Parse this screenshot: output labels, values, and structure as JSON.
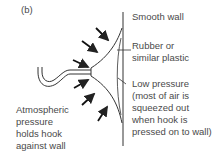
{
  "figure": {
    "panel_label": "(b)",
    "labels": {
      "smooth_wall": "Smooth wall",
      "rubber_line1": "Rubber or",
      "rubber_line2": "similar plastic",
      "low_line1": "Low pressure",
      "low_line2": "(most of air is",
      "low_line3": "squeezed out",
      "low_line4": "when hook is",
      "low_line5": "pressed on to wall)",
      "atm_line1": "Atmospheric",
      "atm_line2": "pressure",
      "atm_line3": "holds hook",
      "atm_line4": "against wall"
    },
    "colors": {
      "line": "#333333",
      "text": "#4a4a4a",
      "background": "#ffffff"
    }
  }
}
